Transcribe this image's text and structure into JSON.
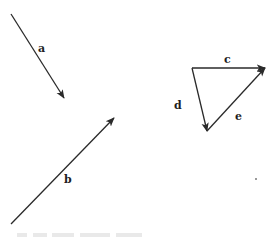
{
  "figure": {
    "background": "#ffffff",
    "stroke_color": "#2a2a2a",
    "vectors": [
      {
        "id": "a",
        "label": "a",
        "from": [
          11,
          14
        ],
        "to": [
          64,
          98
        ],
        "label_pos": [
          38,
          52
        ]
      },
      {
        "id": "b",
        "label": "b",
        "from": [
          11,
          224
        ],
        "to": [
          114,
          118
        ],
        "label_pos": [
          64,
          183
        ]
      },
      {
        "id": "c",
        "label": "c",
        "from": [
          192,
          68
        ],
        "to": [
          265,
          68
        ],
        "label_pos": [
          224,
          63
        ]
      },
      {
        "id": "d",
        "label": "d",
        "from": [
          192,
          68
        ],
        "to": [
          207,
          131
        ],
        "label_pos": [
          174,
          109
        ]
      },
      {
        "id": "e",
        "label": "e",
        "from": [
          207,
          131
        ],
        "to": [
          265,
          68
        ],
        "label_pos": [
          235,
          120
        ]
      }
    ]
  }
}
